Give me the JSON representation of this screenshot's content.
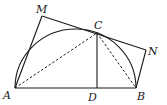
{
  "diagram": {
    "type": "geometry",
    "colors": {
      "stroke": "#1a1a1a",
      "background": "#ffffff"
    },
    "points": {
      "A": {
        "label": "A",
        "x": 15,
        "y": 88
      },
      "B": {
        "label": "B",
        "x": 136,
        "y": 88
      },
      "C": {
        "label": "C",
        "x": 97,
        "y": 33
      },
      "D": {
        "label": "D",
        "x": 97,
        "y": 88
      },
      "M": {
        "label": "M",
        "x": 42,
        "y": 16
      },
      "N": {
        "label": "N",
        "x": 146,
        "y": 50
      }
    },
    "segments": [
      {
        "from": "A",
        "to": "B",
        "style": "solid"
      },
      {
        "from": "A",
        "to": "M",
        "style": "solid"
      },
      {
        "from": "M",
        "to": "N",
        "style": "solid"
      },
      {
        "from": "N",
        "to": "B",
        "style": "solid"
      },
      {
        "from": "C",
        "to": "D",
        "style": "solid"
      },
      {
        "from": "A",
        "to": "C",
        "style": "dashed"
      },
      {
        "from": "C",
        "to": "B",
        "style": "dashed"
      }
    ],
    "arcs": [
      {
        "name": "semicircle",
        "from": "A",
        "to": "B",
        "center_x": 75.5,
        "center_y": 88,
        "rx": 60.5,
        "ry": 59
      }
    ]
  }
}
